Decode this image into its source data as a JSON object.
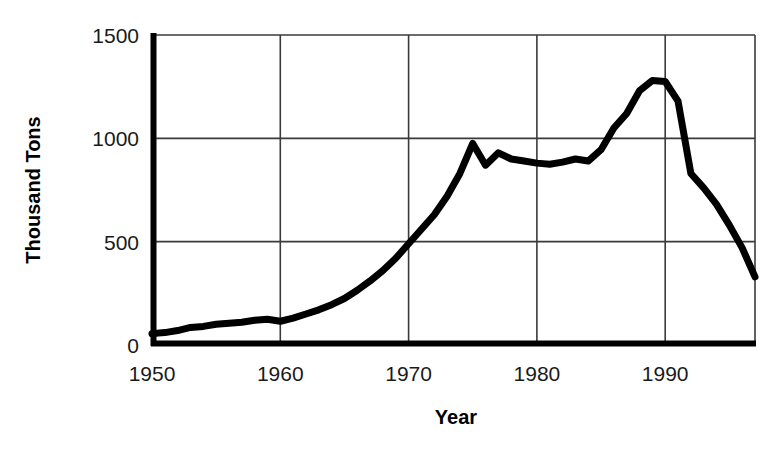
{
  "chart_data": {
    "type": "line",
    "title": "",
    "xlabel": "Year",
    "ylabel": "Thousand Tons",
    "xlim": [
      1950,
      1997
    ],
    "ylim": [
      0,
      1500
    ],
    "grid": true,
    "legend": "none",
    "xticks": [
      1950,
      1960,
      1970,
      1980,
      1990
    ],
    "xtick_labels": [
      "1950",
      "1960",
      "1970",
      "1980",
      "1990"
    ],
    "yticks": [
      0,
      500,
      1000,
      1500
    ],
    "ytick_labels": [
      "0",
      "500",
      "1000",
      "1500"
    ],
    "line_color": "#000000",
    "line_width": 7,
    "x": [
      1950,
      1951,
      1952,
      1953,
      1954,
      1955,
      1956,
      1957,
      1958,
      1959,
      1960,
      1961,
      1962,
      1963,
      1964,
      1965,
      1966,
      1967,
      1968,
      1969,
      1970,
      1971,
      1972,
      1973,
      1974,
      1975,
      1976,
      1977,
      1978,
      1979,
      1980,
      1981,
      1982,
      1983,
      1984,
      1985,
      1986,
      1987,
      1988,
      1989,
      1990,
      1991,
      1992,
      1993,
      1994,
      1995,
      1996,
      1997
    ],
    "values": [
      55,
      60,
      70,
      85,
      90,
      100,
      105,
      110,
      120,
      125,
      115,
      130,
      150,
      170,
      195,
      225,
      265,
      310,
      360,
      420,
      490,
      560,
      630,
      720,
      830,
      975,
      870,
      930,
      900,
      890,
      880,
      875,
      885,
      900,
      890,
      945,
      1050,
      1120,
      1230,
      1280,
      1275,
      1180,
      830,
      760,
      680,
      580,
      470,
      330
    ],
    "series": [
      {
        "name": "Production",
        "values": [
          55,
          60,
          70,
          85,
          90,
          100,
          105,
          110,
          120,
          125,
          115,
          130,
          150,
          170,
          195,
          225,
          265,
          310,
          360,
          420,
          490,
          560,
          630,
          720,
          830,
          975,
          870,
          930,
          900,
          890,
          880,
          875,
          885,
          900,
          890,
          945,
          1050,
          1120,
          1230,
          1280,
          1275,
          1180,
          830,
          760,
          680,
          580,
          470,
          330
        ]
      }
    ],
    "annotations": [
      {
        "label": "peak",
        "x": 1989,
        "y": 1280
      },
      {
        "label": "local-peak",
        "x": 1975,
        "y": 975
      },
      {
        "label": "end",
        "x": 1997,
        "y": 330
      }
    ]
  },
  "axes": {
    "y_axis_title": "Thousand Tons",
    "x_axis_title": "Year"
  }
}
